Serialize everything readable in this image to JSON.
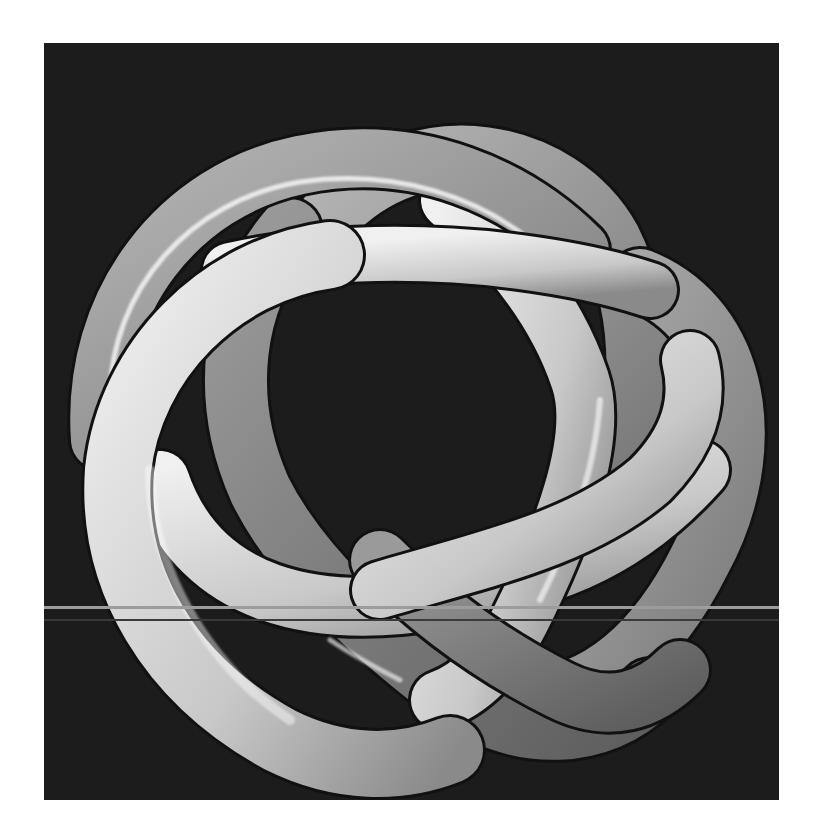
{
  "image": {
    "subject": "3D rendered knotted tube on black background",
    "colors": {
      "page_background": "#ffffff",
      "panel_background": "#1c1c1c",
      "tube_light": "#e6e6e6",
      "tube_mid": "#a8a8a8",
      "tube_dark": "#6e6e6e",
      "highlight": "#ffffff",
      "scanline": "#9c9c9c"
    },
    "artifacts": {
      "scanline_y": 606,
      "faint_scanline_y": 619
    }
  }
}
